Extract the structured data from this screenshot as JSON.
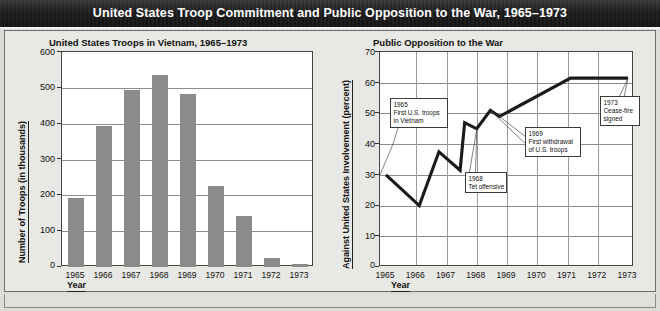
{
  "header": {
    "title": "United States Troop Commitment and Public Opposition to the War, 1965–1973"
  },
  "left_panel": {
    "title": "United States Troops in Vietnam, 1965–1973",
    "y_title": "Number of Troops (in thousands)",
    "x_title": "Year"
  },
  "right_panel": {
    "title": "Public Opposition to the War",
    "y_title": "Against United States Involvement (percent)",
    "x_title": "Year"
  },
  "chart_data": [
    {
      "type": "bar",
      "title": "United States Troops in Vietnam, 1965–1973",
      "xlabel": "Year",
      "ylabel": "Number of Troops (in thousands)",
      "categories": [
        "1965",
        "1966",
        "1967",
        "1968",
        "1969",
        "1970",
        "1971",
        "1972",
        "1973"
      ],
      "values": [
        193,
        393,
        493,
        535,
        484,
        226,
        142,
        24,
        9
      ],
      "ylim": [
        0,
        600
      ],
      "yticks": [
        0,
        100,
        200,
        300,
        400,
        500,
        600
      ],
      "grid": true,
      "legend": "none",
      "bar_color": "#8b8b8b"
    },
    {
      "type": "line",
      "title": "Public Opposition to the War",
      "xlabel": "Year",
      "ylabel": "Against United States Involvement (percent)",
      "ylim": [
        0,
        70
      ],
      "yticks": [
        0,
        10,
        20,
        30,
        40,
        50,
        60,
        70
      ],
      "xticks": [
        "1965",
        "1966",
        "1967",
        "1968",
        "1969",
        "1970",
        "1971",
        "1972",
        "1973"
      ],
      "grid": true,
      "legend": "none",
      "line_color": "#1a1a1a",
      "x": [
        1965.0,
        1966.1,
        1966.75,
        1967.45,
        1967.6,
        1968.0,
        1968.45,
        1968.75,
        1971.1,
        1973.0
      ],
      "y": [
        30,
        20,
        37.5,
        31.5,
        47,
        45,
        51,
        49,
        61.5,
        61.5
      ],
      "annotations": [
        {
          "id": "a1965",
          "lines": [
            "1965",
            "First U.S. troops",
            "in Vietnam"
          ]
        },
        {
          "id": "a1968",
          "lines": [
            "1968",
            "Tet offensive"
          ]
        },
        {
          "id": "a1969",
          "lines": [
            "1969",
            "First withdrawal",
            "of U.S. troops"
          ]
        },
        {
          "id": "a1973",
          "lines": [
            "1973",
            "Cease-fire",
            "signed"
          ]
        }
      ]
    }
  ]
}
